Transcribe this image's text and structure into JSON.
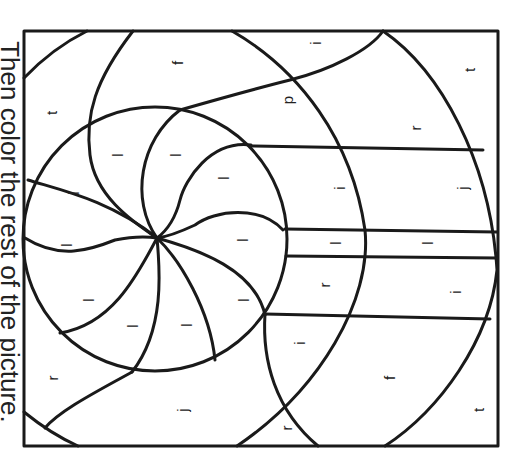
{
  "instruction": "Then color the rest of the picture.",
  "colors": {
    "line": "#1a1a1a",
    "background": "#ffffff"
  },
  "frame": {
    "x": 24,
    "y": 31,
    "width": 474,
    "height": 415
  },
  "labels": [
    {
      "letter": "t",
      "x": 52,
      "y": 113
    },
    {
      "letter": "f",
      "x": 178,
      "y": 63
    },
    {
      "letter": "p",
      "x": 288,
      "y": 100
    },
    {
      "letter": "i",
      "x": 316,
      "y": 43
    },
    {
      "letter": "r",
      "x": 416,
      "y": 128
    },
    {
      "letter": "t",
      "x": 470,
      "y": 70
    },
    {
      "letter": "l",
      "x": 118,
      "y": 155
    },
    {
      "letter": "l",
      "x": 176,
      "y": 155
    },
    {
      "letter": "l",
      "x": 224,
      "y": 178
    },
    {
      "letter": "l",
      "x": 74,
      "y": 193
    },
    {
      "letter": "i",
      "x": 340,
      "y": 188
    },
    {
      "letter": "j",
      "x": 463,
      "y": 188
    },
    {
      "letter": "l",
      "x": 67,
      "y": 245
    },
    {
      "letter": "l",
      "x": 243,
      "y": 240
    },
    {
      "letter": "l",
      "x": 336,
      "y": 243
    },
    {
      "letter": "l",
      "x": 428,
      "y": 243
    },
    {
      "letter": "l",
      "x": 89,
      "y": 300
    },
    {
      "letter": "l",
      "x": 133,
      "y": 326
    },
    {
      "letter": "l",
      "x": 187,
      "y": 325
    },
    {
      "letter": "l",
      "x": 244,
      "y": 300
    },
    {
      "letter": "r",
      "x": 325,
      "y": 285
    },
    {
      "letter": "i",
      "x": 456,
      "y": 292
    },
    {
      "letter": "i",
      "x": 300,
      "y": 343
    },
    {
      "letter": "f",
      "x": 390,
      "y": 378
    },
    {
      "letter": "t",
      "x": 479,
      "y": 410
    },
    {
      "letter": "r",
      "x": 53,
      "y": 378
    },
    {
      "letter": "j",
      "x": 183,
      "y": 410
    },
    {
      "letter": "r",
      "x": 287,
      "y": 428
    }
  ]
}
